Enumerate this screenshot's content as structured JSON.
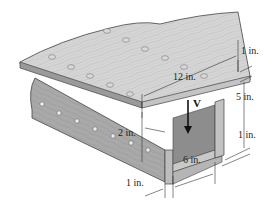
{
  "figure": {
    "colors": {
      "wood_top": "#d9d9d9",
      "wood_side_light": "#c8c8c8",
      "wood_side_dark": "#9e9e9e",
      "inner_shadow": "#8a8a8a",
      "nail": "#efefef",
      "line": "#333333"
    }
  },
  "labels": {
    "force": "V",
    "top_thickness": "1 in.",
    "top_width": "12 in.",
    "web_height": "5 in.",
    "right_wall": "1 in.",
    "inner_width": "6 in.",
    "overhang": "2 in.",
    "left_wall": "1 in."
  }
}
